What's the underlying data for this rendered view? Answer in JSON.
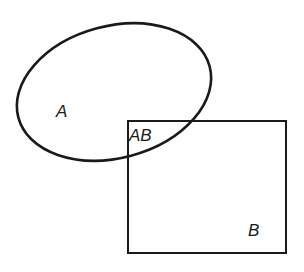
{
  "diagram": {
    "type": "venn-diagram",
    "colors": {
      "stroke": "#1a1a1a",
      "background": "#ffffff"
    },
    "shapes": {
      "set_a": {
        "shape": "ellipse",
        "label": "A"
      },
      "set_b": {
        "shape": "rectangle",
        "label": "B"
      },
      "intersection": {
        "label": "AB"
      }
    }
  }
}
